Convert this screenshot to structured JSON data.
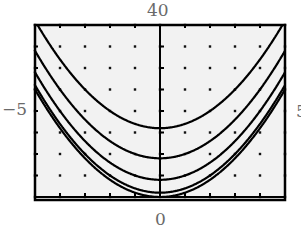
{
  "chart_data": {
    "type": "line",
    "title": "",
    "xlabel": "",
    "ylabel": "",
    "xlim": [
      -5,
      5
    ],
    "ylim": [
      0,
      40
    ],
    "grid": "dots",
    "x_tick_step": 1,
    "y_tick_step": 5,
    "axis_labels": {
      "top": "40",
      "left": "-5",
      "right": "5",
      "bottom": "0"
    },
    "series": [
      {
        "name": "y = x^2",
        "constant": 0
      },
      {
        "name": "y = x^2 + 1",
        "constant": 1
      },
      {
        "name": "y = x^2 + 4",
        "constant": 4
      },
      {
        "name": "y = x^2 + 9",
        "constant": 9
      },
      {
        "name": "y = x^2 + 16",
        "constant": 16
      }
    ],
    "colors": {
      "background": "#f2f2f2",
      "curve": "#000000",
      "frame": "#000000",
      "label": "#6a6a6a"
    }
  },
  "labels": {
    "top": "40",
    "left": "−5",
    "right": "5",
    "bottom": "0"
  }
}
